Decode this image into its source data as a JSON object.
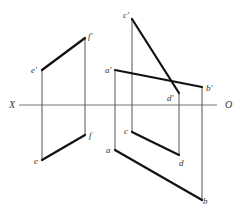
{
  "header": {
    "partial_text": ""
  },
  "diagram": {
    "type": "orthographic-projection",
    "axis": {
      "left_label": "X",
      "right_label": "O"
    },
    "points": {
      "e_prime": "e'",
      "f_prime": "f'",
      "e": "e",
      "f": "f",
      "c_prime": "c'",
      "d_prime": "d'",
      "a_prime": "a'",
      "b_prime": "b'",
      "a": "a",
      "b": "b",
      "c": "c",
      "d": "d"
    },
    "segments": [
      {
        "name": "e'f'",
        "from": [
          42,
          70
        ],
        "to": [
          85,
          38
        ],
        "style": "thick"
      },
      {
        "name": "ef",
        "from": [
          42,
          160
        ],
        "to": [
          85,
          135
        ],
        "style": "thick"
      },
      {
        "name": "c'd'",
        "from": [
          132,
          19
        ],
        "to": [
          179,
          93
        ],
        "style": "thick"
      },
      {
        "name": "a'b'",
        "from": [
          115,
          70
        ],
        "to": [
          202,
          87
        ],
        "style": "thick"
      },
      {
        "name": "cd",
        "from": [
          131,
          132
        ],
        "to": [
          179,
          155
        ],
        "style": "thick"
      },
      {
        "name": "ab",
        "from": [
          114,
          150
        ],
        "to": [
          202,
          200
        ],
        "style": "thick"
      }
    ]
  }
}
